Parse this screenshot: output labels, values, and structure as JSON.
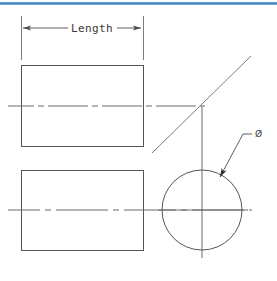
{
  "page": {
    "width": 277,
    "height": 281,
    "background_color": "#ffffff"
  },
  "header_rule": {
    "name": "top-divider",
    "color": "#4a86c8",
    "y": 3,
    "thickness": 3
  },
  "palette": {
    "line_color": "#4d4d4d",
    "object_line_color": "#555555",
    "center_line_color": "#6b6b6b",
    "text_color": "#3a3a3a",
    "accent_blue": "#4a86c8"
  },
  "dimension": {
    "name": "length-dimension",
    "label": "Length",
    "label_x": 82,
    "label_y": 32,
    "dim_line_y": 28,
    "left_x": 21,
    "right_x": 143,
    "ext_line_top": 16,
    "ext_line_bottom": 60,
    "arrow_style": "filled-closed",
    "arrow_direction": "outward"
  },
  "symbols": {
    "diameter": {
      "name": "diameter-symbol",
      "glyph": "Ø",
      "x": 256,
      "y": 133
    }
  },
  "leader": {
    "name": "diameter-leader",
    "arrow_tip_x": 219,
    "arrow_tip_y": 179,
    "elbow_x": 243,
    "elbow_y": 134,
    "landing_end_x": 252,
    "landing_end_y": 134
  },
  "views": {
    "front_view": {
      "name": "front-view-rectangle",
      "x": 21,
      "y": 65,
      "width": 122,
      "height": 81,
      "centerline_y": 106,
      "centerline_x1": 8,
      "centerline_x2": 205
    },
    "top_view": {
      "name": "top-view-rectangle",
      "x": 21,
      "y": 170,
      "width": 122,
      "height": 80,
      "centerline_y": 210,
      "centerline_x1": 8,
      "centerline_x2": 250
    },
    "side_view": {
      "name": "side-view-circle",
      "center_x": 202,
      "center_y": 210,
      "radius": 40,
      "v_centerline_y1": 166,
      "v_centerline_y2": 256,
      "h_centerline_x1": 158,
      "h_centerline_x2": 248
    }
  },
  "projection": {
    "miter_line": {
      "name": "miter-projection-line",
      "x1": 152,
      "y1": 153,
      "x2": 251,
      "y2": 56,
      "angle_degrees": 45
    },
    "vertical_projection": {
      "name": "vertical-projection-line",
      "x": 202,
      "y1": 106,
      "y2": 258
    }
  },
  "line_styles": {
    "object": {
      "name": "continuous-thick",
      "dash": "none",
      "width": 1
    },
    "center": {
      "name": "long-dash-short-dash",
      "dash": "26 4 5 4",
      "width": 1
    },
    "thin": {
      "name": "continuous-thin",
      "dash": "none",
      "width": 0.9
    }
  }
}
